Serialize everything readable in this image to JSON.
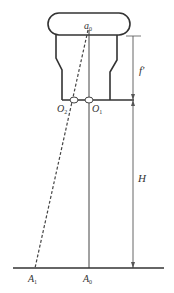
{
  "diagram": {
    "type": "optical-geometry",
    "labels": {
      "a0": {
        "main": "a",
        "sub": "0"
      },
      "O2": {
        "main": "O",
        "sub": "2"
      },
      "O1": {
        "main": "O",
        "sub": "1"
      },
      "f_prime": "f'",
      "H": "H",
      "A1": {
        "main": "A",
        "sub": "1"
      },
      "A0": {
        "main": "A",
        "sub": "0"
      }
    },
    "colors": {
      "stroke": "#333333",
      "background": "#ffffff"
    }
  }
}
